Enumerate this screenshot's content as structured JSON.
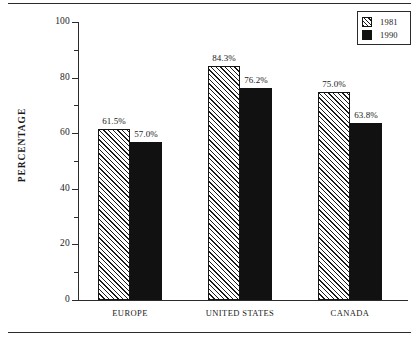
{
  "chart_data": {
    "type": "bar",
    "title": "",
    "xlabel": "",
    "ylabel": "PERCENTAGE",
    "ylim": [
      0,
      100
    ],
    "ytick_labels": [
      "0",
      "20",
      "40",
      "60",
      "80",
      "100"
    ],
    "ytick_values": [
      0,
      20,
      40,
      60,
      80,
      100
    ],
    "yminor_values": [
      10,
      30,
      50,
      70,
      90
    ],
    "grid": false,
    "legend_position": "top-right",
    "categories": [
      "EUROPE",
      "UNITED STATES",
      "CANADA"
    ],
    "series": [
      {
        "name": "1981",
        "fill": "hatch",
        "color": "#ffffff",
        "values": [
          61.5,
          84.3,
          75.0
        ],
        "labels": [
          "61.5%",
          "84.3%",
          "75.0%"
        ]
      },
      {
        "name": "1990",
        "fill": "solid",
        "color": "#111111",
        "values": [
          57.0,
          76.2,
          63.8
        ],
        "labels": [
          "57.0%",
          "76.2%",
          "63.8%"
        ]
      }
    ]
  },
  "legend": {
    "entries": [
      {
        "label": "1981"
      },
      {
        "label": "1990"
      }
    ]
  },
  "axis": {
    "y_title": "PERCENTAGE",
    "ticks": [
      "100",
      "80",
      "60",
      "40",
      "20",
      "0"
    ]
  }
}
